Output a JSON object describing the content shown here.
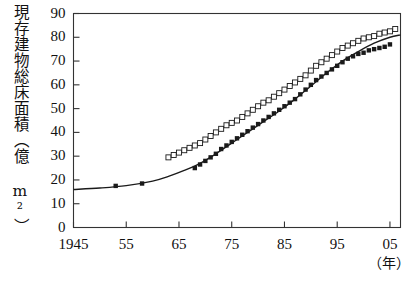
{
  "chart_data": {
    "type": "scatter",
    "title": "",
    "subtitle": "",
    "ylabel": "現存建物総床面積（億 m²）",
    "xlabel": "（年）",
    "xlabel_note": "year",
    "xlim": [
      1945,
      2007
    ],
    "ylim": [
      0,
      90
    ],
    "ytick_values": [
      0,
      10,
      20,
      30,
      40,
      50,
      60,
      70,
      80,
      90
    ],
    "ytick_labels": [
      "0",
      "10",
      "20",
      "30",
      "40",
      "50",
      "60",
      "70",
      "80",
      "90"
    ],
    "xtick_values": [
      1945,
      1955,
      1965,
      1975,
      1985,
      1995,
      2005
    ],
    "xtick_labels": [
      "1945",
      "55",
      "65",
      "75",
      "85",
      "95",
      "05"
    ],
    "grid": false,
    "legend": "none",
    "legend_position": "none",
    "series": [
      {
        "name": "open-square-series",
        "marker": "open-square",
        "marker_color": "#ffffff",
        "marker_edge_color": "#1a1a1a",
        "points": [
          {
            "x": 1963,
            "y": 29.5
          },
          {
            "x": 1964,
            "y": 30.5
          },
          {
            "x": 1965,
            "y": 31.5
          },
          {
            "x": 1966,
            "y": 32.5
          },
          {
            "x": 1967,
            "y": 33.5
          },
          {
            "x": 1968,
            "y": 34.5
          },
          {
            "x": 1969,
            "y": 35.5
          },
          {
            "x": 1970,
            "y": 37.0
          },
          {
            "x": 1971,
            "y": 38.5
          },
          {
            "x": 1972,
            "y": 40.0
          },
          {
            "x": 1973,
            "y": 41.5
          },
          {
            "x": 1974,
            "y": 43.0
          },
          {
            "x": 1975,
            "y": 44.0
          },
          {
            "x": 1976,
            "y": 45.0
          },
          {
            "x": 1977,
            "y": 46.5
          },
          {
            "x": 1978,
            "y": 48.0
          },
          {
            "x": 1979,
            "y": 49.5
          },
          {
            "x": 1980,
            "y": 51.0
          },
          {
            "x": 1981,
            "y": 52.5
          },
          {
            "x": 1982,
            "y": 53.5
          },
          {
            "x": 1983,
            "y": 55.0
          },
          {
            "x": 1984,
            "y": 56.5
          },
          {
            "x": 1985,
            "y": 58.0
          },
          {
            "x": 1986,
            "y": 59.5
          },
          {
            "x": 1987,
            "y": 61.0
          },
          {
            "x": 1988,
            "y": 62.5
          },
          {
            "x": 1989,
            "y": 64.0
          },
          {
            "x": 1990,
            "y": 66.0
          },
          {
            "x": 1991,
            "y": 68.0
          },
          {
            "x": 1992,
            "y": 69.5
          },
          {
            "x": 1993,
            "y": 71.0
          },
          {
            "x": 1994,
            "y": 72.5
          },
          {
            "x": 1995,
            "y": 74.0
          },
          {
            "x": 1996,
            "y": 75.5
          },
          {
            "x": 1997,
            "y": 76.5
          },
          {
            "x": 1998,
            "y": 77.5
          },
          {
            "x": 1999,
            "y": 78.5
          },
          {
            "x": 2000,
            "y": 79.5
          },
          {
            "x": 2001,
            "y": 80.0
          },
          {
            "x": 2002,
            "y": 80.5
          },
          {
            "x": 2003,
            "y": 81.5
          },
          {
            "x": 2004,
            "y": 82.0
          },
          {
            "x": 2005,
            "y": 82.5
          },
          {
            "x": 2006,
            "y": 83.5
          }
        ]
      },
      {
        "name": "filled-square-series",
        "marker": "filled-square",
        "marker_color": "#1a1a1a",
        "marker_edge_color": "#1a1a1a",
        "points": [
          {
            "x": 1953,
            "y": 17.5
          },
          {
            "x": 1958,
            "y": 18.5
          },
          {
            "x": 1968,
            "y": 25.0
          },
          {
            "x": 1969,
            "y": 26.5
          },
          {
            "x": 1970,
            "y": 28.0
          },
          {
            "x": 1971,
            "y": 29.5
          },
          {
            "x": 1972,
            "y": 31.0
          },
          {
            "x": 1973,
            "y": 33.0
          },
          {
            "x": 1974,
            "y": 34.5
          },
          {
            "x": 1975,
            "y": 36.0
          },
          {
            "x": 1976,
            "y": 37.5
          },
          {
            "x": 1977,
            "y": 39.0
          },
          {
            "x": 1978,
            "y": 40.5
          },
          {
            "x": 1979,
            "y": 42.0
          },
          {
            "x": 1980,
            "y": 43.5
          },
          {
            "x": 1981,
            "y": 45.0
          },
          {
            "x": 1982,
            "y": 46.5
          },
          {
            "x": 1983,
            "y": 48.0
          },
          {
            "x": 1984,
            "y": 49.5
          },
          {
            "x": 1985,
            "y": 51.0
          },
          {
            "x": 1986,
            "y": 52.5
          },
          {
            "x": 1987,
            "y": 54.0
          },
          {
            "x": 1988,
            "y": 56.0
          },
          {
            "x": 1989,
            "y": 58.0
          },
          {
            "x": 1990,
            "y": 60.0
          },
          {
            "x": 1991,
            "y": 62.0
          },
          {
            "x": 1992,
            "y": 63.5
          },
          {
            "x": 1993,
            "y": 65.0
          },
          {
            "x": 1994,
            "y": 66.5
          },
          {
            "x": 1995,
            "y": 68.0
          },
          {
            "x": 1996,
            "y": 69.5
          },
          {
            "x": 1997,
            "y": 71.0
          },
          {
            "x": 1998,
            "y": 72.0
          },
          {
            "x": 1999,
            "y": 73.0
          },
          {
            "x": 2000,
            "y": 73.5
          },
          {
            "x": 2001,
            "y": 74.5
          },
          {
            "x": 2002,
            "y": 75.0
          },
          {
            "x": 2003,
            "y": 75.5
          },
          {
            "x": 2004,
            "y": 76.0
          },
          {
            "x": 2005,
            "y": 77.0
          }
        ]
      },
      {
        "name": "fitted-curve",
        "marker": "none",
        "line_color": "#1a1a1a",
        "points": [
          {
            "x": 1945,
            "y": 16.0
          },
          {
            "x": 1950,
            "y": 16.6
          },
          {
            "x": 1955,
            "y": 17.6
          },
          {
            "x": 1960,
            "y": 19.5
          },
          {
            "x": 1963,
            "y": 21.5
          },
          {
            "x": 1966,
            "y": 24.0
          },
          {
            "x": 1969,
            "y": 27.0
          },
          {
            "x": 1972,
            "y": 31.0
          },
          {
            "x": 1975,
            "y": 35.5
          },
          {
            "x": 1978,
            "y": 40.0
          },
          {
            "x": 1981,
            "y": 44.5
          },
          {
            "x": 1984,
            "y": 49.0
          },
          {
            "x": 1987,
            "y": 54.0
          },
          {
            "x": 1990,
            "y": 59.5
          },
          {
            "x": 1993,
            "y": 65.0
          },
          {
            "x": 1996,
            "y": 70.0
          },
          {
            "x": 1999,
            "y": 74.0
          },
          {
            "x": 2002,
            "y": 77.5
          },
          {
            "x": 2005,
            "y": 80.0
          },
          {
            "x": 2007,
            "y": 81.0
          }
        ]
      }
    ]
  },
  "axes": {
    "ylabel": "現存建物総床面積（億 m²）",
    "xunit": "（年）"
  }
}
